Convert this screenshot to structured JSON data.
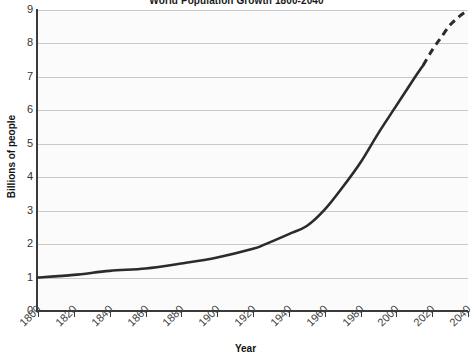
{
  "chart_data": {
    "type": "line",
    "title": "World Population Growth 1800-2040",
    "xlabel": "Year",
    "ylabel": "Billions of people",
    "xlim": [
      1800,
      2040
    ],
    "ylim": [
      0,
      9
    ],
    "grid": true,
    "legend": "none",
    "xticks": [
      "1800",
      "1820",
      "1840",
      "1860",
      "1880",
      "1900",
      "1920",
      "1940",
      "1960",
      "1980",
      "2000",
      "2020",
      "2040"
    ],
    "xtick_values": [
      1800,
      1820,
      1840,
      1860,
      1880,
      1900,
      1920,
      1940,
      1960,
      1980,
      2000,
      2020,
      2040
    ],
    "yticks": [
      "0",
      "1",
      "2",
      "3",
      "4",
      "5",
      "6",
      "7",
      "8",
      "9"
    ],
    "ytick_values": [
      0,
      1,
      2,
      3,
      4,
      5,
      6,
      7,
      8,
      9
    ],
    "series": [
      {
        "name": "Historical population",
        "style": "solid",
        "color": "#2b2b2b",
        "x": [
          1800,
          1820,
          1840,
          1860,
          1880,
          1900,
          1920,
          1927,
          1940,
          1950,
          1960,
          1970,
          1980,
          1990,
          2000,
          2010,
          2015
        ],
        "values": [
          1.0,
          1.08,
          1.2,
          1.27,
          1.42,
          1.6,
          1.86,
          2.0,
          2.3,
          2.54,
          3.03,
          3.7,
          4.44,
          5.32,
          6.14,
          6.96,
          7.35
        ]
      },
      {
        "name": "Projected population",
        "style": "dashed",
        "color": "#2b2b2b",
        "x": [
          2015,
          2020,
          2025,
          2030,
          2035,
          2040
        ],
        "values": [
          7.35,
          7.8,
          8.18,
          8.55,
          8.8,
          9.0
        ]
      }
    ]
  }
}
